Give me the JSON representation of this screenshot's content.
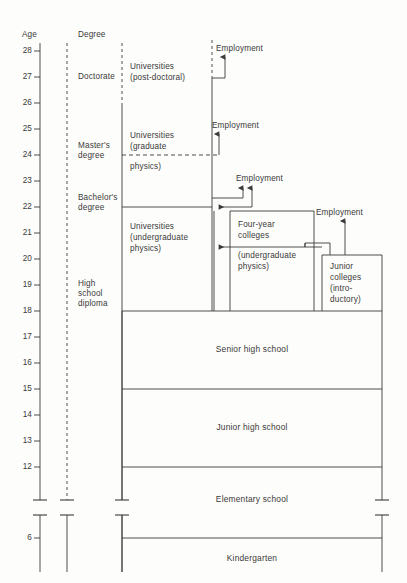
{
  "figure": {
    "axis_header": "Age",
    "degree_header": "Degree",
    "age_ticks": [
      28,
      27,
      26,
      25,
      24,
      23,
      22,
      21,
      20,
      19,
      18,
      17,
      16,
      15,
      14,
      13,
      12,
      6
    ],
    "axis_break": true,
    "line_color": "#3a3a3a",
    "background_color": "#fdfdfb"
  },
  "degrees": [
    {
      "name": "doctorate",
      "label": "Doctorate"
    },
    {
      "name": "masters-degree",
      "label": "Master's\ndegree"
    },
    {
      "name": "bachelors-degree",
      "label": "Bachelor's\ndegree"
    },
    {
      "name": "high-school-diploma",
      "label": "High\nschool\ndiploma"
    }
  ],
  "institutions": [
    {
      "name": "universities-post-doctoral",
      "label": "Universities\n(post-doctoral)"
    },
    {
      "name": "universities-graduate-physics",
      "label": "Universities\n(graduate\n\nphysics)"
    },
    {
      "name": "universities-graduate-line1",
      "label": "Universities"
    },
    {
      "name": "universities-graduate-line2",
      "label": "(graduate"
    },
    {
      "name": "universities-graduate-line3",
      "label": "physics)"
    },
    {
      "name": "universities-undergraduate-physics",
      "label": "Universities\n(undergraduate\nphysics)"
    },
    {
      "name": "four-year-colleges",
      "label": "Four-year\ncolleges"
    },
    {
      "name": "four-year-colleges-sub",
      "label": "(undergraduate\nphysics)"
    },
    {
      "name": "junior-colleges",
      "label": "Junior\ncolleges\n(intro-\nductory)"
    }
  ],
  "schools": [
    {
      "name": "senior-high-school",
      "label": "Senior high school"
    },
    {
      "name": "junior-high-school",
      "label": "Junior high school"
    },
    {
      "name": "elementary-school",
      "label": "Elementary school"
    },
    {
      "name": "kindergarten",
      "label": "Kindergarten"
    }
  ],
  "employment_labels": [
    {
      "name": "employment-post-doctoral",
      "label": "Employment"
    },
    {
      "name": "employment-graduate",
      "label": "Employment"
    },
    {
      "name": "employment-undergraduate",
      "label": "Employment"
    },
    {
      "name": "employment-junior-college",
      "label": "Employment"
    }
  ],
  "text": {
    "age": "Age",
    "degree": "Degree",
    "doctorate": "Doctorate",
    "masters_l1": "Master's",
    "masters_l2": "degree",
    "bachelors_l1": "Bachelor's",
    "bachelors_l2": "degree",
    "hs_l1": "High",
    "hs_l2": "school",
    "hs_l3": "diploma",
    "univ_post_l1": "Universities",
    "univ_post_l2": "(post-doctoral)",
    "univ_grad_l1": "Universities",
    "univ_grad_l2": "(graduate",
    "univ_grad_l3": "physics)",
    "univ_ug_l1": "Universities",
    "univ_ug_l2": "(undergraduate",
    "univ_ug_l3": "physics)",
    "four_year_l1": "Four-year",
    "four_year_l2": "colleges",
    "four_year_l3": "(undergraduate",
    "four_year_l4": "physics)",
    "junior_l1": "Junior",
    "junior_l2": "colleges",
    "junior_l3": "(intro-",
    "junior_l4": "ductory)",
    "employment": "Employment",
    "senior_high": "Senior high school",
    "junior_high": "Junior high school",
    "elementary": "Elementary school",
    "kindergarten": "Kindergarten",
    "t28": "28",
    "t27": "27",
    "t26": "26",
    "t25": "25",
    "t24": "24",
    "t23": "23",
    "t22": "22",
    "t21": "21",
    "t20": "20",
    "t19": "19",
    "t18": "18",
    "t17": "17",
    "t16": "16",
    "t15": "15",
    "t14": "14",
    "t13": "13",
    "t12": "12",
    "t6": "6"
  }
}
